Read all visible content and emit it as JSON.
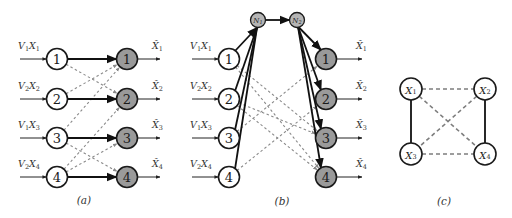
{
  "figure": {
    "panels": [
      {
        "id": "a",
        "caption": "(a)",
        "inputs": [
          {
            "v": "V",
            "v_sub": "1",
            "x": "X",
            "x_sub": "1"
          },
          {
            "v": "V",
            "v_sub": "2",
            "x": "X",
            "x_sub": "2"
          },
          {
            "v": "V",
            "v_sub": "1",
            "x": "X",
            "x_sub": "3"
          },
          {
            "v": "V",
            "v_sub": "2",
            "x": "X",
            "x_sub": "4"
          }
        ],
        "sources": [
          "1",
          "2",
          "3",
          "4"
        ],
        "sinks": [
          "1",
          "2",
          "3",
          "4"
        ],
        "outputs": [
          {
            "x": "X̂",
            "sub": "1"
          },
          {
            "x": "X̂",
            "sub": "2"
          },
          {
            "x": "X̂",
            "sub": "3"
          },
          {
            "x": "X̂",
            "sub": "4"
          }
        ],
        "solid_edges": [
          [
            1,
            1
          ],
          [
            2,
            2
          ],
          [
            3,
            3
          ],
          [
            4,
            4
          ]
        ],
        "dashed_edges": [
          [
            1,
            2
          ],
          [
            2,
            1
          ],
          [
            3,
            1
          ],
          [
            3,
            4
          ],
          [
            4,
            2
          ],
          [
            4,
            3
          ]
        ]
      },
      {
        "id": "b",
        "caption": "(b)",
        "inputs": [
          {
            "v": "V",
            "v_sub": "1",
            "x": "X",
            "x_sub": "1"
          },
          {
            "v": "V",
            "v_sub": "2",
            "x": "X",
            "x_sub": "2"
          },
          {
            "v": "V",
            "v_sub": "1",
            "x": "X",
            "x_sub": "3"
          },
          {
            "v": "V",
            "v_sub": "2",
            "x": "X",
            "x_sub": "4"
          }
        ],
        "sources": [
          "1",
          "2",
          "3",
          "4"
        ],
        "relays": [
          {
            "n": "N",
            "sub": "1"
          },
          {
            "n": "N",
            "sub": "2"
          }
        ],
        "sinks": [
          "1",
          "2",
          "3",
          "4"
        ],
        "outputs": [
          {
            "x": "X̂",
            "sub": "1"
          },
          {
            "x": "X̂",
            "sub": "2"
          },
          {
            "x": "X̂",
            "sub": "3"
          },
          {
            "x": "X̂",
            "sub": "4"
          }
        ],
        "solid_edges_to_relay": [
          "1",
          "2",
          "3",
          "4"
        ],
        "relay_edge": [
          "N1",
          "N2"
        ],
        "solid_edges_from_relay": [
          "1",
          "2",
          "3",
          "4"
        ],
        "dashed_edges": [
          [
            1,
            3
          ],
          [
            1,
            4
          ],
          [
            2,
            3
          ],
          [
            2,
            4
          ],
          [
            3,
            1
          ],
          [
            4,
            2
          ]
        ]
      },
      {
        "id": "c",
        "caption": "(c)",
        "nodes": [
          {
            "x": "X",
            "sub": "1"
          },
          {
            "x": "X",
            "sub": "2"
          },
          {
            "x": "X",
            "sub": "3"
          },
          {
            "x": "X",
            "sub": "4"
          }
        ],
        "solid_edges": [
          [
            1,
            3
          ],
          [
            2,
            4
          ]
        ],
        "dashed_edges": [
          [
            1,
            2
          ],
          [
            3,
            4
          ],
          [
            1,
            4
          ],
          [
            2,
            3
          ]
        ]
      }
    ]
  }
}
